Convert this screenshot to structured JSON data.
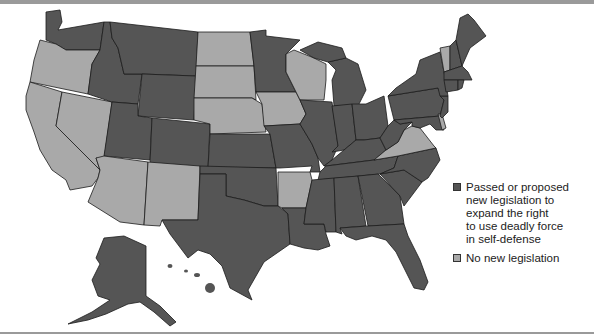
{
  "colors": {
    "passed": "#555555",
    "none": "#a9a9a9",
    "water": "#ffffff",
    "rule": "#9a9a9a"
  },
  "legend": {
    "items": [
      {
        "key": "passed",
        "label": "Passed or proposed\nnew legislation to\nexpand the right\nto use deadly force\nin self-defense"
      },
      {
        "key": "none",
        "label": "No new legislation"
      }
    ]
  },
  "states": {
    "WA": "passed",
    "OR": "none",
    "CA": "none",
    "NV": "none",
    "ID": "passed",
    "MT": "passed",
    "WY": "passed",
    "UT": "passed",
    "AZ": "none",
    "NM": "none",
    "CO": "passed",
    "ND": "none",
    "SD": "none",
    "NE": "none",
    "KS": "passed",
    "OK": "passed",
    "TX": "passed",
    "MN": "passed",
    "IA": "none",
    "MO": "passed",
    "AR": "none",
    "LA": "passed",
    "WI": "none",
    "IL": "passed",
    "MI": "passed",
    "IN": "passed",
    "OH": "passed",
    "KY": "passed",
    "TN": "passed",
    "MS": "passed",
    "AL": "passed",
    "GA": "passed",
    "FL": "passed",
    "SC": "passed",
    "NC": "passed",
    "VA": "none",
    "WV": "passed",
    "PA": "passed",
    "NY": "passed",
    "VT": "none",
    "NH": "passed",
    "ME": "passed",
    "MA": "passed",
    "RI": "passed",
    "CT": "passed",
    "NJ": "passed",
    "DE": "none",
    "MD": "passed",
    "AK": "passed",
    "HI": "passed"
  }
}
